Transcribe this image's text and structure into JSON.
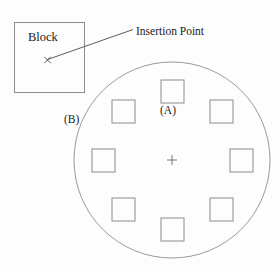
{
  "figure": {
    "background_color": "#fdfdfd",
    "stroke_color": "#8c8c8c",
    "leader_color": "#5a5a5a",
    "text_color": "#1a1a1a",
    "width": 280,
    "height": 271
  },
  "labels": {
    "block": "Block",
    "insertion_point": "Insertion Point",
    "callout_a": "(A)",
    "callout_b": "(B)"
  },
  "block_shape": {
    "name": "block-rectangle",
    "x": 14,
    "y": 22,
    "width": 70,
    "height": 70
  },
  "insertion_point_marker": {
    "name": "insertion-point-x-marker",
    "x": 47,
    "y": 60,
    "size": 3.2,
    "glyph": "x-cross"
  },
  "leader_line": {
    "name": "insertion-point-leader-line",
    "x1": 47.5,
    "y1": 59.5,
    "x2": 133,
    "y2": 29.5
  },
  "circle": {
    "name": "array-path-circle",
    "cx": 172,
    "cy": 160,
    "r": 98
  },
  "center_marker": {
    "name": "array-center-cross",
    "cx": 172,
    "cy": 160,
    "arm": 5,
    "glyph": "plus-cross"
  },
  "array": {
    "type": "polar",
    "item_count": 8,
    "angle_step_degrees": 45,
    "array_radius": 69,
    "item_size": 23,
    "items": [
      {
        "index": 0,
        "angle_degrees": 90,
        "cx": 172,
        "cy": 91,
        "position": "top"
      },
      {
        "index": 1,
        "angle_degrees": 45,
        "cx": 221,
        "cy": 111,
        "position": "top-right"
      },
      {
        "index": 2,
        "angle_degrees": 0,
        "cx": 241,
        "cy": 160,
        "position": "right"
      },
      {
        "index": 3,
        "angle_degrees": 315,
        "cx": 221,
        "cy": 209,
        "position": "bottom-right"
      },
      {
        "index": 4,
        "angle_degrees": 270,
        "cx": 172,
        "cy": 229,
        "position": "bottom"
      },
      {
        "index": 5,
        "angle_degrees": 225,
        "cx": 123,
        "cy": 209,
        "position": "bottom-left"
      },
      {
        "index": 6,
        "angle_degrees": 180,
        "cx": 103,
        "cy": 160,
        "position": "left"
      },
      {
        "index": 7,
        "angle_degrees": 135,
        "cx": 123,
        "cy": 111,
        "position": "top-left"
      }
    ]
  }
}
